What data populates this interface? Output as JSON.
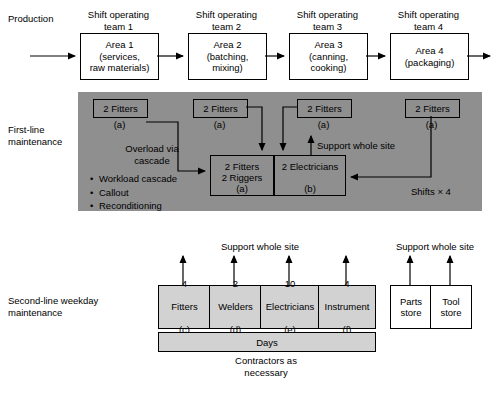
{
  "row_labels": {
    "production": "Production",
    "first_line": "First-line\nmaintenance",
    "second_line": "Second-line weekday\nmaintenance"
  },
  "production": {
    "teams": [
      {
        "team": "Shift operating\nteam 1",
        "area": "Area 1\n(services,\nraw materials)"
      },
      {
        "team": "Shift operating\nteam 2",
        "area": "Area 2\n(batching,\nmixing)"
      },
      {
        "team": "Shift operating\nteam 3",
        "area": "Area 3\n(canning,\ncooking)"
      },
      {
        "team": "Shift operating\nteam 4",
        "area": "Area 4\n(packaging)"
      }
    ]
  },
  "first_line": {
    "top_boxes": [
      {
        "label": "2 Fitters",
        "note": "(a)"
      },
      {
        "label": "2 Fitters",
        "note": "(a)"
      },
      {
        "label": "2 Fitters",
        "note": "(a)"
      },
      {
        "label": "2 Fitters",
        "note": "(a)"
      }
    ],
    "cascade_text": "Overload via\ncascade",
    "bullets": [
      "Workload cascade",
      "Callout",
      "Reconditioning"
    ],
    "central_left": {
      "label": "2 Fitters\n2 Riggers",
      "note": "(a)"
    },
    "central_right": {
      "label": "2 Electricians",
      "note": "(b)"
    },
    "support_text": "Support whole site",
    "shifts_text": "Shifts × 4"
  },
  "second_line": {
    "support_text_left": "Support whole site",
    "support_text_right": "Support whole site",
    "columns": [
      {
        "count": "4",
        "role": "Fitters",
        "note": "(c)"
      },
      {
        "count": "2",
        "role": "Welders",
        "note": "(d)"
      },
      {
        "count": "10",
        "role": "Electricians",
        "note": "(e)"
      },
      {
        "count": "4",
        "role": "Instrument",
        "note": "(f)"
      }
    ],
    "days_label": "Days",
    "contractors_text": "Contractors as\nnecessary",
    "stores": [
      "Parts\nstore",
      "Tool\nstore"
    ]
  },
  "colors": {
    "panel_gray": "#8f8f8f",
    "cell_gray": "#d2d2d2",
    "line": "#000000",
    "background": "#ffffff"
  }
}
